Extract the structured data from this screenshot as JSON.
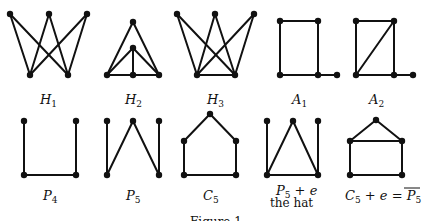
{
  "figure": {
    "caption": "Figure 1",
    "graphs": [
      {
        "id": "H1",
        "label_main": "H",
        "label_sub": "1",
        "nodes": [
          "t1",
          "t2",
          "t3",
          "b1",
          "b2"
        ],
        "edges": [
          [
            "t1",
            "b1"
          ],
          [
            "t1",
            "b2"
          ],
          [
            "t2",
            "b1"
          ],
          [
            "t2",
            "b2"
          ],
          [
            "t3",
            "b1"
          ],
          [
            "t3",
            "b2"
          ]
        ]
      },
      {
        "id": "H2",
        "label_main": "H",
        "label_sub": "2",
        "nodes": [
          "top",
          "mid",
          "bl",
          "bm",
          "br"
        ],
        "edges": [
          [
            "top",
            "bl"
          ],
          [
            "top",
            "br"
          ],
          [
            "mid",
            "bl"
          ],
          [
            "mid",
            "br"
          ],
          [
            "mid",
            "bm"
          ],
          [
            "bl",
            "bm"
          ],
          [
            "bm",
            "br"
          ]
        ]
      },
      {
        "id": "H3",
        "label_main": "H",
        "label_sub": "3",
        "nodes": [
          "t1",
          "t2",
          "t3",
          "b1",
          "b2"
        ],
        "edges": [
          [
            "t1",
            "b1"
          ],
          [
            "t1",
            "b2"
          ],
          [
            "t2",
            "b1"
          ],
          [
            "t2",
            "b2"
          ],
          [
            "t3",
            "b1"
          ],
          [
            "t3",
            "b2"
          ],
          [
            "b1",
            "b2"
          ]
        ]
      },
      {
        "id": "A1",
        "label_main": "A",
        "label_sub": "1",
        "nodes": [
          "tl",
          "tr",
          "bl",
          "br",
          "tail"
        ],
        "edges": [
          [
            "tl",
            "tr"
          ],
          [
            "tl",
            "bl"
          ],
          [
            "tr",
            "br"
          ],
          [
            "bl",
            "br"
          ],
          [
            "br",
            "tail"
          ]
        ]
      },
      {
        "id": "A2",
        "label_main": "A",
        "label_sub": "2",
        "nodes": [
          "tl",
          "tr",
          "bl",
          "br",
          "tail"
        ],
        "edges": [
          [
            "tl",
            "tr"
          ],
          [
            "tl",
            "bl"
          ],
          [
            "tr",
            "br"
          ],
          [
            "bl",
            "br"
          ],
          [
            "br",
            "tail"
          ],
          [
            "bl",
            "tr"
          ]
        ]
      },
      {
        "id": "P4",
        "label_main": "P",
        "label_sub": "4",
        "nodes": [
          "tl",
          "tr",
          "bl",
          "br"
        ],
        "edges": [
          [
            "tl",
            "bl"
          ],
          [
            "bl",
            "br"
          ],
          [
            "br",
            "tr"
          ]
        ]
      },
      {
        "id": "P5",
        "label_main": "P",
        "label_sub": "5",
        "nodes": [
          "tl",
          "tm",
          "tr",
          "bl",
          "br"
        ],
        "edges": [
          [
            "tl",
            "bl"
          ],
          [
            "bl",
            "tm"
          ],
          [
            "tm",
            "br"
          ],
          [
            "br",
            "tr"
          ]
        ]
      },
      {
        "id": "C5",
        "label_main": "C",
        "label_sub": "5",
        "nodes": [
          "apex",
          "ml",
          "mr",
          "bl",
          "br"
        ],
        "edges": [
          [
            "apex",
            "ml"
          ],
          [
            "apex",
            "mr"
          ],
          [
            "ml",
            "bl"
          ],
          [
            "mr",
            "br"
          ],
          [
            "bl",
            "br"
          ]
        ]
      },
      {
        "id": "hat",
        "label_main": "P",
        "label_sub": "5",
        "label_suffix": " + e",
        "label_line2": "the hat",
        "nodes": [
          "tl",
          "tm",
          "tr",
          "bl",
          "br"
        ],
        "edges": [
          [
            "tl",
            "bl"
          ],
          [
            "bl",
            "tm"
          ],
          [
            "tm",
            "br"
          ],
          [
            "br",
            "tr"
          ],
          [
            "bl",
            "br"
          ]
        ]
      },
      {
        "id": "C5e",
        "label_main": "C",
        "label_sub": "5",
        "label_suffix": " + e = ",
        "label_rhs_main": "P",
        "label_rhs_sub": "5",
        "label_rhs_overline": true,
        "nodes": [
          "apex",
          "ml",
          "mr",
          "bl",
          "br"
        ],
        "edges": [
          [
            "apex",
            "ml"
          ],
          [
            "apex",
            "mr"
          ],
          [
            "ml",
            "mr"
          ],
          [
            "ml",
            "bl"
          ],
          [
            "mr",
            "br"
          ],
          [
            "bl",
            "br"
          ]
        ]
      }
    ]
  }
}
